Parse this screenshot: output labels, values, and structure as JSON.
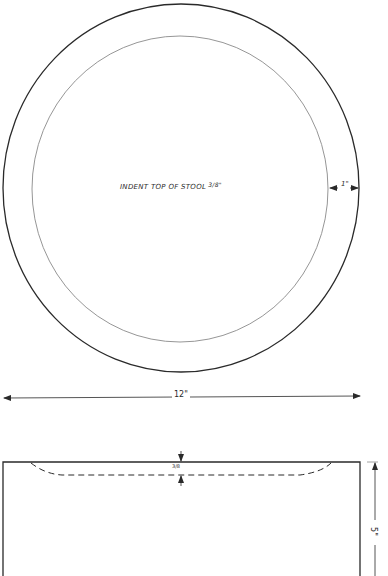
{
  "drawing": {
    "subject": "Stool top plan and side elevation",
    "top_view": {
      "note": "INDENT TOP OF STOOL",
      "note_fraction": "3/8\"",
      "rim_width": "1\"",
      "diameter": "12\""
    },
    "side_view": {
      "indent_depth": "3/8",
      "height": "5\""
    },
    "colors": {
      "line": "#2a2a2a",
      "inner_line": "#8a8a8a",
      "background": "#ffffff"
    }
  }
}
